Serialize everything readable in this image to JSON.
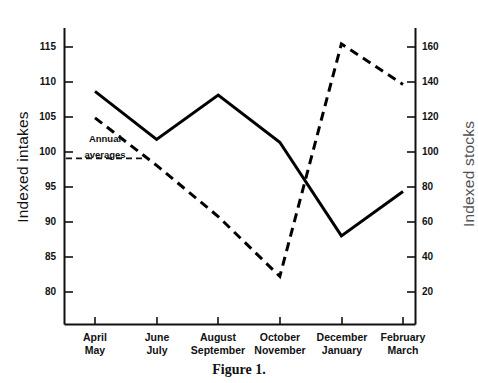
{
  "figure": {
    "caption": "Figure 1."
  },
  "chart_data": {
    "type": "line",
    "title": "",
    "xlabel": "",
    "ylabel": "Indexed intakes",
    "y2label": "Indexed stocks",
    "categories": [
      "April\nMay",
      "June\nJuly",
      "August\nSeptember",
      "October\nNovember",
      "December\nJanuary",
      "February\nMarch"
    ],
    "category_lines": [
      [
        "April",
        "May"
      ],
      [
        "June",
        "July"
      ],
      [
        "August",
        "September"
      ],
      [
        "October",
        "November"
      ],
      [
        "December",
        "January"
      ],
      [
        "February",
        "March"
      ]
    ],
    "series": [
      {
        "name": "Indexed intakes",
        "axis": "left",
        "style": "solid",
        "color": "#000000",
        "values": [
          109.5,
          102.7,
          109.0,
          102.3,
          89.0,
          95.3
        ]
      },
      {
        "name": "Indexed stocks",
        "axis": "right",
        "style": "dashed",
        "color": "#000000",
        "values": [
          123,
          96,
          67,
          33,
          165,
          142
        ]
      }
    ],
    "ylim": [
      76.5,
      118.5
    ],
    "y2lim": [
      6,
      174
    ],
    "yticks": [
      80,
      85,
      90,
      95,
      100,
      105,
      110,
      115
    ],
    "y2ticks": [
      20,
      40,
      60,
      80,
      100,
      120,
      140,
      160
    ],
    "grid": false,
    "legend": "none",
    "annotations": [
      {
        "name": "annual-averages",
        "line_1": "Annual",
        "line_2": "averages",
        "value": 100,
        "axis": "left",
        "style": "dashed-reference-line"
      }
    ]
  },
  "axis": {
    "left_ticks": [
      "115",
      "110",
      "105",
      "100",
      "95",
      "90",
      "85",
      "80"
    ],
    "right_ticks": [
      "160",
      "140",
      "120",
      "100",
      "80",
      "60",
      "40",
      "20"
    ]
  },
  "colors": {
    "ink": "#000000",
    "axis": "#111111",
    "background": "#ffffff"
  }
}
